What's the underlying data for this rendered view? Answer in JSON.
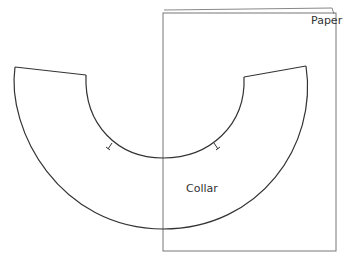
{
  "diagram": {
    "type": "sewing-pattern-layout",
    "labels": {
      "paper": "Paper",
      "collar": "Collar"
    },
    "colors": {
      "background": "#ffffff",
      "collar_stroke": "#333333",
      "paper_stroke": "#777777",
      "text": "#333333"
    },
    "shapes": {
      "paper": {
        "x": 163,
        "y": 12,
        "width": 173,
        "height": 239
      },
      "collar": {
        "outer_arc": {
          "start": [
            15,
            67
          ],
          "bottom": [
            163,
            229
          ],
          "end": [
            306,
            66
          ]
        },
        "inner_arc": {
          "start": [
            86,
            75
          ],
          "bottom": [
            163,
            158
          ],
          "end": [
            244,
            77
          ]
        },
        "notches": [
          [
            110,
            146
          ],
          [
            216,
            146
          ]
        ]
      }
    }
  }
}
